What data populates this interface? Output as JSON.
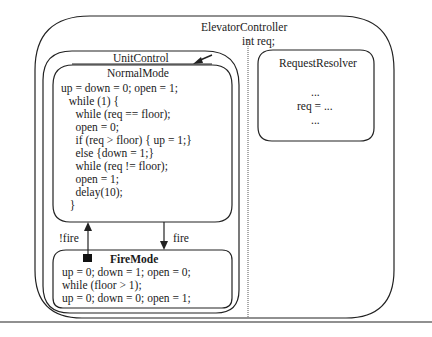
{
  "diagram": {
    "elevator_controller": {
      "title": "ElevatorController",
      "declaration": "int req;"
    },
    "unit_control": {
      "title": "UnitControl",
      "normal_mode": {
        "title": "NormalMode",
        "code": [
          "up = down = 0; open = 1;",
          "  while (1) {",
          "    while (req == floor);",
          "    open = 0;",
          "    if (req > floor) { up = 1;}",
          "    else {down = 1;}",
          "    while (req != floor);",
          "    open = 1;",
          "    delay(10);",
          "  }"
        ]
      },
      "fire_mode": {
        "title": "FireMode",
        "code": [
          "up = 0; down = 1; open = 0;",
          "while (floor > 1);",
          "up = 0; down = 0; open = 1;"
        ]
      },
      "transitions": [
        {
          "label": "!fire",
          "from": "FireMode",
          "to": "NormalMode"
        },
        {
          "label": "fire",
          "from": "NormalMode",
          "to": "FireMode"
        }
      ]
    },
    "request_resolver": {
      "title": "RequestResolver",
      "code": [
        "...",
        "req = ...",
        "..."
      ]
    }
  }
}
